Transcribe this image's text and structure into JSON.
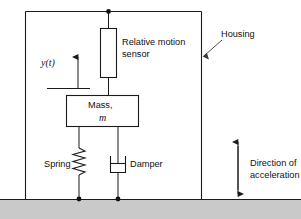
{
  "figure": {
    "background_color": "#ffffff",
    "line_color": "#1a1a1a",
    "ground_color": "#c9c9c9"
  },
  "labels": {
    "relative_motion_sensor_line1": "Relative motion",
    "relative_motion_sensor_line2": "sensor",
    "housing": "Housing",
    "mass_line1": "Mass,",
    "mass_symbol": "m",
    "spring": "Spring",
    "damper": "Damper",
    "displacement_symbol": "y(t)",
    "direction_line1": "Direction of",
    "direction_line2": "acceleration"
  },
  "components": {
    "housing": {
      "x": 25,
      "y": 11,
      "width": 176,
      "height": 188
    },
    "sensor_box": {
      "x": 100,
      "y": 28,
      "width": 17,
      "height": 50
    },
    "mass_box": {
      "x": 66,
      "y": 95,
      "width": 73,
      "height": 32
    },
    "spring": {
      "x": 79,
      "top": 145,
      "bottom": 199,
      "coils": 6
    },
    "damper": {
      "x": 118,
      "top": 140,
      "bottom": 199
    },
    "ground": {
      "y": 199,
      "height": 20
    }
  },
  "annotations": {
    "displacement_arrow": {
      "x": 78,
      "from_y": 88,
      "to_y": 55
    },
    "housing_leader": {
      "from_x": 222,
      "from_y": 40,
      "to_x": 203,
      "to_y": 56
    },
    "acceleration_arrow": {
      "x": 238,
      "top_y": 138,
      "bottom_y": 197
    }
  }
}
